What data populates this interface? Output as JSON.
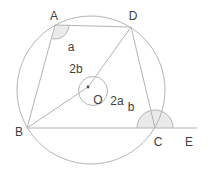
{
  "diagram": {
    "type": "geometry-circle-figure",
    "point_labels": {
      "A": "A",
      "D": "D",
      "B": "B",
      "C": "C",
      "E": "E",
      "O": "O"
    },
    "angle_labels": {
      "at_A": "a",
      "at_O_upper_left": "2b",
      "at_O_lower_right": "2a",
      "at_C": "b"
    },
    "colors": {
      "line": "#b4b4b4",
      "text": "#3f3f3f",
      "angle_shade": "#eaeaea",
      "background": "#ffffff"
    }
  }
}
